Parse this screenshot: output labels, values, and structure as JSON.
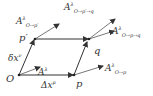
{
  "diagram": {
    "points": [
      {
        "id": "O",
        "label": "O"
      },
      {
        "id": "p",
        "label": "p"
      },
      {
        "id": "p_prime",
        "label": "p′"
      },
      {
        "id": "q",
        "label": "q"
      }
    ],
    "edges": [
      {
        "from": "O",
        "to": "p",
        "label": "Δx",
        "label_sup": "μ"
      },
      {
        "from": "O",
        "to": "p_prime",
        "label": "δx",
        "label_sup": "ν"
      },
      {
        "from": "p_prime",
        "to": "q"
      },
      {
        "from": "p",
        "to": "q"
      }
    ],
    "vectors": [
      {
        "at": "O",
        "base": "A",
        "sup": "λ",
        "sub": ""
      },
      {
        "at": "p",
        "base": "A",
        "sup": "λ",
        "sub": "O→p"
      },
      {
        "at": "p_prime",
        "base": "A",
        "sup": "λ",
        "sub": "O→p′"
      },
      {
        "at": "q",
        "base": "A",
        "sup": "λ",
        "sub": "O→p′→q"
      },
      {
        "at": "q",
        "base": "A",
        "sup": "λ",
        "sub": "O→p→q"
      }
    ],
    "colors": {
      "line": "#333333",
      "background": "#ffffff"
    }
  }
}
